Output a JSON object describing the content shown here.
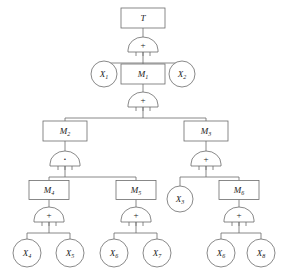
{
  "diagram": {
    "type": "fault-tree",
    "colors": {
      "stroke": "#6b6b6b",
      "text": "#1a1a1a",
      "background": "#ffffff"
    },
    "gate_symbols": {
      "or": "+",
      "and": "·"
    },
    "nodes": [
      {
        "id": "T",
        "label": "T",
        "sub": "",
        "shape": "rect",
        "x": 143,
        "y": 18,
        "w": 44,
        "h": 20
      },
      {
        "id": "X1",
        "label": "X",
        "sub": "1",
        "shape": "circle",
        "x": 104,
        "y": 74,
        "r": 13
      },
      {
        "id": "M1",
        "label": "M",
        "sub": "1",
        "shape": "rect",
        "x": 143,
        "y": 74,
        "w": 44,
        "h": 20
      },
      {
        "id": "X2",
        "label": "X",
        "sub": "2",
        "shape": "circle",
        "x": 182,
        "y": 74,
        "r": 13
      },
      {
        "id": "M2",
        "label": "M",
        "sub": "2",
        "shape": "rect",
        "x": 65,
        "y": 131,
        "w": 44,
        "h": 20
      },
      {
        "id": "M3",
        "label": "M",
        "sub": "3",
        "shape": "rect",
        "x": 206,
        "y": 131,
        "w": 44,
        "h": 20
      },
      {
        "id": "M4",
        "label": "M",
        "sub": "4",
        "shape": "rect",
        "x": 49,
        "y": 190,
        "w": 40,
        "h": 19
      },
      {
        "id": "M5",
        "label": "M",
        "sub": "5",
        "shape": "rect",
        "x": 136,
        "y": 190,
        "w": 40,
        "h": 19
      },
      {
        "id": "X3",
        "label": "X",
        "sub": "3",
        "shape": "circle",
        "x": 180,
        "y": 199,
        "r": 13
      },
      {
        "id": "M6",
        "label": "M",
        "sub": "6",
        "shape": "rect",
        "x": 239,
        "y": 190,
        "w": 40,
        "h": 19
      },
      {
        "id": "X4",
        "label": "X",
        "sub": "4",
        "shape": "circle",
        "x": 27,
        "y": 253,
        "r": 14
      },
      {
        "id": "X5",
        "label": "X",
        "sub": "5",
        "shape": "circle",
        "x": 70,
        "y": 253,
        "r": 14
      },
      {
        "id": "X6",
        "label": "X",
        "sub": "6",
        "shape": "circle",
        "x": 114,
        "y": 253,
        "r": 14
      },
      {
        "id": "X7",
        "label": "X",
        "sub": "7",
        "shape": "circle",
        "x": 157,
        "y": 253,
        "r": 14
      },
      {
        "id": "X6b",
        "label": "X",
        "sub": "6",
        "shape": "circle",
        "x": 221,
        "y": 253,
        "r": 14
      },
      {
        "id": "X8",
        "label": "X",
        "sub": "8",
        "shape": "circle",
        "x": 261,
        "y": 253,
        "r": 14
      }
    ],
    "gates": [
      {
        "id": "g-T",
        "type": "or",
        "symbol": "+",
        "x": 143,
        "y": 52,
        "parent": "T",
        "children": [
          "X1",
          "M1",
          "X2"
        ]
      },
      {
        "id": "g-M1",
        "type": "or",
        "symbol": "+",
        "x": 143,
        "y": 107,
        "parent": "M1",
        "children": [
          "M2",
          "M3"
        ]
      },
      {
        "id": "g-M2",
        "type": "and",
        "symbol": "·",
        "x": 65,
        "y": 166,
        "parent": "M2",
        "children": [
          "M4",
          "M5"
        ]
      },
      {
        "id": "g-M3",
        "type": "or",
        "symbol": "+",
        "x": 206,
        "y": 166,
        "parent": "M3",
        "children": [
          "X3",
          "M6"
        ]
      },
      {
        "id": "g-M4",
        "type": "or",
        "symbol": "+",
        "x": 49,
        "y": 222,
        "parent": "M4",
        "children": [
          "X4",
          "X5"
        ]
      },
      {
        "id": "g-M5",
        "type": "or",
        "symbol": "+",
        "x": 136,
        "y": 222,
        "parent": "M5",
        "children": [
          "X6",
          "X7"
        ]
      },
      {
        "id": "g-M6",
        "type": "or",
        "symbol": "+",
        "x": 239,
        "y": 222,
        "parent": "M6",
        "children": [
          "X6b",
          "X8"
        ]
      }
    ]
  }
}
